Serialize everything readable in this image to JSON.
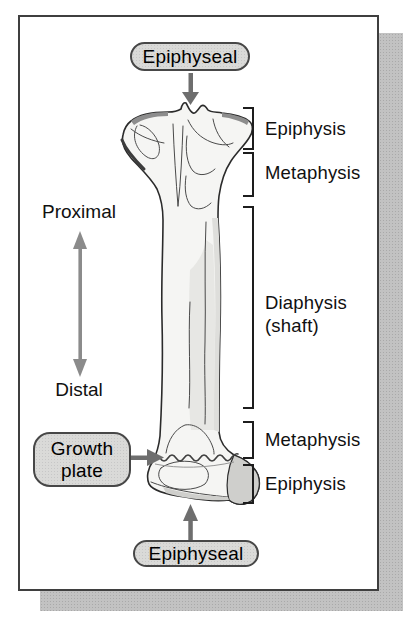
{
  "callouts": {
    "top": {
      "label": "Epiphyseal"
    },
    "bottom": {
      "label": "Epiphyseal"
    },
    "growth_plate": {
      "line1": "Growth",
      "line2": "plate"
    }
  },
  "orientation": {
    "proximal": "Proximal",
    "distal": "Distal"
  },
  "regions": [
    {
      "label": "Epiphysis"
    },
    {
      "label": "Metaphysis"
    },
    {
      "label": "Diaphysis",
      "sub": "(shaft)"
    },
    {
      "label": "Metaphysis"
    },
    {
      "label": "Epiphysis"
    }
  ],
  "icons": {
    "down-arrow-icon": "▼",
    "up-arrow-icon": "▲",
    "right-arrow-icon": "▶",
    "double-headed-arrow-icon": "↕"
  },
  "colors": {
    "panel_border": "#3f3f3f",
    "panel_bg": "#ffffff",
    "shadow": "#c2c2c2",
    "callout_fill": "#dadad8",
    "callout_border": "#474747",
    "arrow": "#6e6e6e",
    "orientation_arrow": "#8b8b8b",
    "bracket": "#1d1d1d",
    "text": "#101010",
    "bone_fill": "#f5f5f3",
    "bone_outline": "#2b2b2b",
    "bone_shade": "#dededb",
    "bone_shade_dark": "#cfcfcc",
    "bone_top_edge": "#8d8d8d"
  }
}
